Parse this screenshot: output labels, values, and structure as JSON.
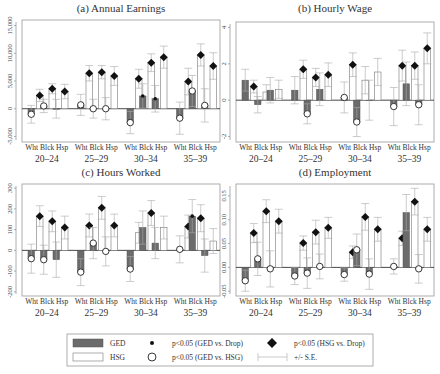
{
  "legend": {
    "ged_label": "GED",
    "hsg_label": "HSG",
    "dot_label": "p<0.05 (GED vs. Drop)",
    "ring_label": "p<0.05 (GED vs. HSG)",
    "diamond_label": "p<0.05 (HSG vs. Drop)",
    "se_label": "+/- S.E.",
    "colors": {
      "ged": "#6b6b6b",
      "hsg": "#ffffff"
    }
  },
  "group_labels": [
    "Wht",
    "Blck",
    "Hsp"
  ],
  "age_labels": [
    "20–24",
    "25–29",
    "30–34",
    "35–39"
  ],
  "chart_data": [
    {
      "type": "bar",
      "title": "(a) Annual Earnings",
      "ylabel": "",
      "ylim": [
        -6000,
        16000
      ],
      "yticks": [
        -5000,
        0,
        5000,
        10000,
        15000
      ],
      "ytick_labels": [
        "-5,000",
        "0",
        "5,000",
        "10,000",
        "15,000"
      ],
      "categories": [
        "20–24",
        "25–29",
        "30–34",
        "35–39"
      ],
      "subgroups": [
        "Wht",
        "Blck",
        "Hsp"
      ],
      "series": [
        {
          "name": "GED",
          "values": [
            [
              -1000,
              500,
              0
            ],
            [
              700,
              0,
              0
            ],
            [
              -2500,
              2300,
              1800
            ],
            [
              -1700,
              3200,
              600
            ]
          ],
          "se": [
            [
              1600,
              1200,
              1700
            ],
            [
              1900,
              1700,
              2000
            ],
            [
              2000,
              2200,
              2400
            ],
            [
              2900,
              2800,
              3000
            ]
          ],
          "ring": [
            [
              true,
              true,
              false
            ],
            [
              true,
              true,
              true
            ],
            [
              true,
              false,
              false
            ],
            [
              true,
              true,
              true
            ]
          ],
          "dot": [
            [
              false,
              false,
              false
            ],
            [
              false,
              false,
              false
            ],
            [
              false,
              true,
              true
            ],
            [
              false,
              false,
              false
            ]
          ]
        },
        {
          "name": "HSG",
          "values": [
            [
              2400,
              3600,
              3100
            ],
            [
              6400,
              6600,
              5900
            ],
            [
              5400,
              8300,
              9300
            ],
            [
              4900,
              9700,
              7700
            ]
          ],
          "se": [
            [
              1100,
              900,
              1300
            ],
            [
              1400,
              1200,
              1700
            ],
            [
              1700,
              1600,
              2000
            ],
            [
              2400,
              2000,
              2400
            ]
          ],
          "diamond": [
            [
              true,
              true,
              true
            ],
            [
              true,
              true,
              true
            ],
            [
              true,
              true,
              true
            ],
            [
              true,
              true,
              true
            ]
          ]
        }
      ]
    },
    {
      "type": "bar",
      "title": "(b) Hourly Wage",
      "ylim": [
        -2.3,
        4.3
      ],
      "yticks": [
        -2,
        0,
        2,
        4
      ],
      "ytick_labels": [
        "-2",
        "0",
        "2",
        "4"
      ],
      "categories": [
        "20–24",
        "25–29",
        "30–34",
        "35–39"
      ],
      "subgroups": [
        "Wht",
        "Blck",
        "Hsp"
      ],
      "series": [
        {
          "name": "GED",
          "values": [
            [
              1.1,
              -0.25,
              0.55
            ],
            [
              0.55,
              -0.75,
              0.6
            ],
            [
              0.15,
              -1.2,
              0.0
            ],
            [
              -0.35,
              0.9,
              -0.25
            ]
          ],
          "se": [
            [
              0.6,
              0.45,
              0.7
            ],
            [
              0.75,
              0.55,
              0.9
            ],
            [
              0.85,
              0.8,
              1.1
            ],
            [
              1.05,
              1.2,
              1.1
            ]
          ],
          "ring": [
            [
              false,
              false,
              false
            ],
            [
              false,
              true,
              false
            ],
            [
              true,
              true,
              false
            ],
            [
              true,
              false,
              true
            ]
          ]
        },
        {
          "name": "HSG",
          "values": [
            [
              0.75,
              0.45,
              0.6
            ],
            [
              1.7,
              1.25,
              1.4
            ],
            [
              1.95,
              1.1,
              1.55
            ],
            [
              1.9,
              1.9,
              2.85
            ]
          ],
          "se": [
            [
              0.35,
              0.4,
              0.5
            ],
            [
              0.5,
              0.5,
              0.65
            ],
            [
              0.65,
              0.75,
              0.75
            ],
            [
              0.85,
              0.75,
              0.85
            ]
          ],
          "diamond": [
            [
              true,
              false,
              false
            ],
            [
              true,
              true,
              true
            ],
            [
              true,
              false,
              false
            ],
            [
              true,
              true,
              true
            ]
          ]
        }
      ]
    },
    {
      "type": "bar",
      "title": "(c) Hours Worked",
      "ylim": [
        -220,
        320
      ],
      "yticks": [
        -200,
        -100,
        0,
        100,
        200,
        300
      ],
      "ytick_labels": [
        "-200",
        "-100",
        "0",
        "100",
        "200",
        "300"
      ],
      "categories": [
        "20–24",
        "25–29",
        "30–34",
        "35–39"
      ],
      "subgroups": [
        "Wht",
        "Blck",
        "Hsp"
      ],
      "series": [
        {
          "name": "GED",
          "values": [
            [
              -40,
              -45,
              -45
            ],
            [
              -105,
              35,
              -5
            ],
            [
              -90,
              110,
              35
            ],
            [
              5,
              165,
              -25
            ]
          ],
          "se": [
            [
              70,
              70,
              85
            ],
            [
              65,
              75,
              70
            ],
            [
              60,
              80,
              75
            ],
            [
              65,
              80,
              80
            ]
          ],
          "ring": [
            [
              true,
              true,
              false
            ],
            [
              true,
              true,
              true
            ],
            [
              true,
              false,
              false
            ],
            [
              true,
              false,
              false
            ]
          ],
          "dot": [
            [
              false,
              false,
              false
            ],
            [
              false,
              false,
              false
            ],
            [
              false,
              false,
              false
            ],
            [
              false,
              true,
              false
            ]
          ]
        },
        {
          "name": "HSG",
          "values": [
            [
              165,
              140,
              110
            ],
            [
              120,
              205,
              120
            ],
            [
              85,
              180,
              110
            ],
            [
              115,
              155,
              45
            ]
          ],
          "se": [
            [
              50,
              50,
              55
            ],
            [
              55,
              55,
              55
            ],
            [
              50,
              60,
              55
            ],
            [
              55,
              65,
              60
            ]
          ],
          "diamond": [
            [
              true,
              true,
              true
            ],
            [
              true,
              true,
              true
            ],
            [
              false,
              true,
              false
            ],
            [
              true,
              true,
              false
            ]
          ]
        }
      ]
    },
    {
      "type": "bar",
      "title": "(d) Employment",
      "ylim": [
        -0.06,
        0.175
      ],
      "yticks": [
        -0.05,
        0.0,
        0.05,
        0.1,
        0.15
      ],
      "ytick_labels": [
        "-0.05",
        "0.00",
        "0.05",
        "0.10",
        "0.15"
      ],
      "categories": [
        "20–24",
        "25–29",
        "30–34",
        "35–39"
      ],
      "subgroups": [
        "Wht",
        "Blck",
        "Hsp"
      ],
      "series": [
        {
          "name": "GED",
          "values": [
            [
              -0.028,
              0.018,
              -0.003
            ],
            [
              -0.018,
              -0.012,
              0.002
            ],
            [
              -0.015,
              0.037,
              -0.014
            ],
            [
              0.002,
              0.115,
              -0.003
            ]
          ],
          "se": [
            [
              0.022,
              0.035,
              0.038
            ],
            [
              0.018,
              0.032,
              0.026
            ],
            [
              0.014,
              0.033,
              0.032
            ],
            [
              0.016,
              0.038,
              0.03
            ]
          ],
          "ring": [
            [
              true,
              true,
              true
            ],
            [
              true,
              true,
              true
            ],
            [
              true,
              true,
              true
            ],
            [
              true,
              false,
              true
            ]
          ],
          "dot": [
            [
              false,
              false,
              false
            ],
            [
              false,
              false,
              false
            ],
            [
              false,
              false,
              false
            ],
            [
              false,
              false,
              false
            ]
          ]
        },
        {
          "name": "HSG",
          "values": [
            [
              0.072,
              0.118,
              0.097
            ],
            [
              0.051,
              0.074,
              0.083
            ],
            [
              0.032,
              0.106,
              0.08
            ],
            [
              0.061,
              0.138,
              0.08
            ]
          ],
          "se": [
            [
              0.02,
              0.024,
              0.025
            ],
            [
              0.015,
              0.025,
              0.022
            ],
            [
              0.013,
              0.028,
              0.025
            ],
            [
              0.015,
              0.028,
              0.025
            ]
          ],
          "diamond": [
            [
              true,
              true,
              true
            ],
            [
              true,
              true,
              true
            ],
            [
              true,
              true,
              true
            ],
            [
              true,
              true,
              true
            ]
          ]
        }
      ]
    }
  ]
}
